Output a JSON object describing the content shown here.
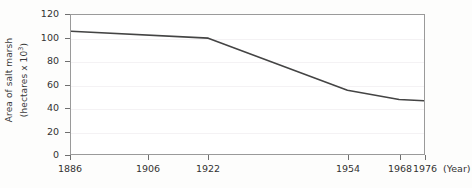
{
  "chart_data": {
    "type": "line",
    "title": "",
    "subtitle": "",
    "xlabel": "Year",
    "xlabel_display": "(Year)",
    "ylabel_line1": "Area of salt marsh",
    "ylabel_line2_prefix": "(hectares x 10",
    "ylabel_line2_exponent": "3",
    "ylabel_line2_suffix": ")",
    "ylabel": "Area of salt marsh (hectares x 10^3)",
    "x": [
      1886,
      1922,
      1954,
      1968,
      1976
    ],
    "values": [
      106,
      100,
      55,
      47,
      46
    ],
    "series": [
      {
        "name": "Area of salt marsh",
        "values": [
          106,
          100,
          55,
          47,
          46
        ]
      }
    ],
    "xticks": [
      1886,
      1906,
      1922,
      1954,
      1968,
      1976
    ],
    "xtick_labels": [
      "1886",
      "1906",
      "1922",
      "1954",
      "1968",
      "1976"
    ],
    "xtick_positions_px": [
      70,
      148,
      208,
      348,
      400,
      425
    ],
    "yticks": [
      0,
      20,
      40,
      60,
      80,
      100,
      120
    ],
    "ytick_labels": [
      "0",
      "20",
      "40",
      "60",
      "80",
      "100",
      "120"
    ],
    "ylim": [
      0,
      120
    ],
    "xlim_px": [
      70,
      425
    ],
    "grid": "horizontal-faint",
    "legend": "none",
    "markers": "none",
    "line_color": "#444444",
    "axis_color": "#9a9a9a",
    "text_color": "#333333",
    "plot_background": "#ffffff",
    "page_background": "#fdfdfc",
    "annotations": []
  }
}
